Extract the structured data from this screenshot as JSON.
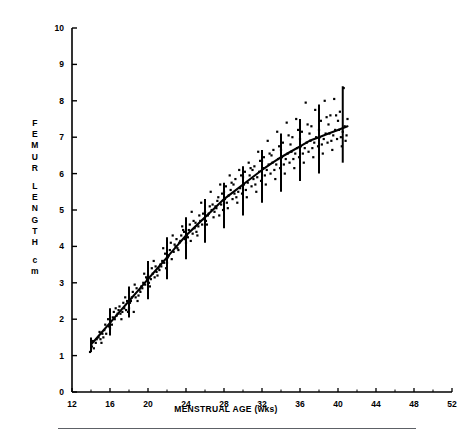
{
  "chart_data": {
    "type": "scatter",
    "title": "",
    "subtitle": "",
    "xlabel": "MENSTRUAL AGE (wks)",
    "ylabel_lines": [
      "F",
      "E",
      "M",
      "U",
      "R",
      "",
      "L",
      "E",
      "N",
      "G",
      "T",
      "H",
      "",
      "c",
      "m"
    ],
    "ylabel_text": "FEMUR LENGTH cm",
    "xlim": [
      12,
      52
    ],
    "ylim": [
      0,
      10
    ],
    "xticks": [
      12,
      16,
      20,
      24,
      28,
      32,
      36,
      40,
      44,
      48,
      52
    ],
    "yticks": [
      0,
      1,
      2,
      3,
      4,
      5,
      6,
      7,
      8,
      9,
      10
    ],
    "x_minor_step": 2,
    "grid": false,
    "legend": false,
    "series": [
      {
        "name": "Regression curve (mean femur length)",
        "type": "line",
        "color": "#000000",
        "x": [
          14,
          15,
          16,
          17,
          18,
          19,
          20,
          21,
          22,
          23,
          24,
          25,
          26,
          27,
          28,
          29,
          30,
          31,
          32,
          33,
          34,
          35,
          36,
          37,
          38,
          39,
          40,
          41
        ],
        "y": [
          1.3,
          1.6,
          1.9,
          2.2,
          2.5,
          2.8,
          3.1,
          3.4,
          3.7,
          4.0,
          4.3,
          4.55,
          4.8,
          5.05,
          5.3,
          5.5,
          5.7,
          5.9,
          6.1,
          6.28,
          6.45,
          6.6,
          6.75,
          6.9,
          7.0,
          7.1,
          7.2,
          7.3
        ]
      },
      {
        "name": "Error bars (±2 SD)",
        "type": "errorbar",
        "color": "#000000",
        "x": [
          14,
          16,
          18,
          20,
          22,
          24,
          26,
          28,
          30,
          32,
          34,
          36,
          38,
          40.5
        ],
        "mean": [
          1.3,
          1.9,
          2.5,
          3.1,
          3.7,
          4.3,
          4.8,
          5.3,
          5.7,
          6.1,
          6.45,
          6.75,
          7.0,
          7.3
        ],
        "lower": [
          1.1,
          1.55,
          2.05,
          2.55,
          3.1,
          3.65,
          4.1,
          4.5,
          4.85,
          5.2,
          5.5,
          5.8,
          6.0,
          6.3
        ],
        "upper": [
          1.5,
          2.3,
          2.9,
          3.6,
          4.25,
          4.8,
          5.3,
          5.75,
          6.2,
          6.65,
          7.1,
          7.5,
          7.9,
          8.4
        ]
      },
      {
        "name": "Individual measurements",
        "type": "scatter",
        "color": "#000000",
        "points": [
          [
            13.9,
            1.1
          ],
          [
            14.1,
            1.25
          ],
          [
            14.3,
            1.2
          ],
          [
            14.2,
            1.4
          ],
          [
            14.5,
            1.35
          ],
          [
            14.8,
            1.5
          ],
          [
            15.0,
            1.45
          ],
          [
            15.2,
            1.6
          ],
          [
            15.1,
            1.35
          ],
          [
            15.4,
            1.7
          ],
          [
            15.6,
            1.6
          ],
          [
            15.3,
            1.5
          ],
          [
            15.9,
            1.8
          ],
          [
            16.1,
            1.95
          ],
          [
            16.0,
            1.75
          ],
          [
            16.3,
            2.05
          ],
          [
            16.2,
            1.85
          ],
          [
            16.5,
            2.0
          ],
          [
            16.4,
            2.2
          ],
          [
            16.7,
            2.1
          ],
          [
            16.9,
            2.25
          ],
          [
            17.1,
            2.15
          ],
          [
            17.0,
            2.35
          ],
          [
            17.3,
            2.2
          ],
          [
            17.2,
            2.0
          ],
          [
            17.5,
            2.3
          ],
          [
            17.7,
            2.25
          ],
          [
            17.4,
            2.45
          ],
          [
            17.9,
            2.2
          ],
          [
            18.1,
            2.45
          ],
          [
            18.0,
            2.3
          ],
          [
            18.3,
            2.6
          ],
          [
            18.2,
            2.5
          ],
          [
            18.5,
            2.2
          ],
          [
            18.4,
            2.75
          ],
          [
            18.7,
            2.6
          ],
          [
            18.9,
            2.5
          ],
          [
            19.1,
            2.8
          ],
          [
            19.0,
            2.65
          ],
          [
            19.3,
            2.9
          ],
          [
            19.2,
            2.75
          ],
          [
            19.5,
            3.0
          ],
          [
            19.4,
            2.85
          ],
          [
            19.7,
            2.95
          ],
          [
            19.9,
            3.1
          ],
          [
            20.1,
            3.0
          ],
          [
            20.0,
            3.2
          ],
          [
            20.3,
            3.1
          ],
          [
            20.2,
            2.9
          ],
          [
            20.5,
            3.25
          ],
          [
            20.4,
            3.4
          ],
          [
            20.7,
            3.15
          ],
          [
            20.9,
            3.3
          ],
          [
            21.1,
            3.4
          ],
          [
            21.0,
            3.2
          ],
          [
            21.3,
            3.5
          ],
          [
            21.2,
            3.35
          ],
          [
            21.5,
            3.6
          ],
          [
            21.4,
            3.45
          ],
          [
            21.7,
            3.55
          ],
          [
            21.9,
            3.4
          ],
          [
            22.1,
            3.7
          ],
          [
            22.0,
            3.55
          ],
          [
            22.3,
            3.9
          ],
          [
            22.2,
            3.75
          ],
          [
            22.5,
            3.65
          ],
          [
            22.4,
            4.1
          ],
          [
            22.7,
            3.85
          ],
          [
            22.9,
            4.0
          ],
          [
            23.1,
            3.95
          ],
          [
            23.0,
            4.2
          ],
          [
            23.3,
            4.1
          ],
          [
            23.2,
            3.9
          ],
          [
            23.5,
            4.3
          ],
          [
            23.4,
            4.15
          ],
          [
            23.7,
            4.45
          ],
          [
            23.9,
            4.2
          ],
          [
            24.1,
            4.3
          ],
          [
            24.0,
            4.1
          ],
          [
            24.3,
            4.45
          ],
          [
            24.2,
            4.25
          ],
          [
            24.5,
            4.15
          ],
          [
            24.4,
            4.6
          ],
          [
            24.7,
            4.35
          ],
          [
            24.9,
            4.5
          ],
          [
            25.1,
            4.4
          ],
          [
            25.0,
            4.65
          ],
          [
            25.3,
            4.55
          ],
          [
            25.2,
            4.3
          ],
          [
            25.5,
            4.7
          ],
          [
            25.4,
            4.85
          ],
          [
            25.7,
            4.6
          ],
          [
            25.9,
            4.75
          ],
          [
            26.1,
            4.7
          ],
          [
            26.0,
            4.95
          ],
          [
            26.3,
            4.85
          ],
          [
            26.2,
            4.6
          ],
          [
            26.5,
            5.1
          ],
          [
            26.4,
            4.9
          ],
          [
            26.7,
            5.0
          ],
          [
            26.9,
            4.8
          ],
          [
            27.1,
            5.1
          ],
          [
            27.0,
            4.95
          ],
          [
            27.3,
            5.25
          ],
          [
            27.2,
            5.05
          ],
          [
            27.5,
            4.85
          ],
          [
            27.4,
            5.35
          ],
          [
            27.7,
            5.15
          ],
          [
            27.9,
            5.0
          ],
          [
            28.1,
            5.3
          ],
          [
            28.0,
            5.5
          ],
          [
            28.3,
            5.2
          ],
          [
            28.2,
            5.65
          ],
          [
            28.5,
            5.4
          ],
          [
            28.4,
            5.05
          ],
          [
            28.7,
            5.55
          ],
          [
            28.9,
            5.3
          ],
          [
            29.1,
            5.45
          ],
          [
            29.0,
            5.7
          ],
          [
            29.3,
            5.35
          ],
          [
            29.2,
            5.85
          ],
          [
            29.5,
            5.5
          ],
          [
            29.4,
            5.2
          ],
          [
            29.7,
            5.6
          ],
          [
            29.9,
            5.45
          ],
          [
            30.1,
            5.7
          ],
          [
            30.0,
            5.9
          ],
          [
            30.3,
            5.55
          ],
          [
            30.2,
            6.05
          ],
          [
            30.5,
            5.75
          ],
          [
            30.4,
            5.35
          ],
          [
            30.7,
            5.95
          ],
          [
            30.9,
            5.65
          ],
          [
            31.1,
            5.85
          ],
          [
            31.0,
            6.1
          ],
          [
            31.3,
            5.7
          ],
          [
            31.2,
            6.2
          ],
          [
            31.5,
            5.9
          ],
          [
            31.4,
            5.5
          ],
          [
            31.7,
            6.05
          ],
          [
            31.9,
            5.8
          ],
          [
            32.1,
            6.15
          ],
          [
            32.0,
            6.35
          ],
          [
            32.3,
            5.95
          ],
          [
            32.2,
            6.45
          ],
          [
            32.5,
            6.1
          ],
          [
            32.4,
            5.7
          ],
          [
            32.7,
            6.25
          ],
          [
            32.9,
            6.0
          ],
          [
            33.1,
            6.3
          ],
          [
            33.0,
            6.5
          ],
          [
            33.3,
            6.1
          ],
          [
            33.2,
            6.65
          ],
          [
            33.5,
            6.25
          ],
          [
            33.4,
            5.85
          ],
          [
            33.7,
            6.4
          ],
          [
            33.9,
            6.15
          ],
          [
            34.1,
            6.45
          ],
          [
            34.0,
            6.65
          ],
          [
            34.3,
            6.25
          ],
          [
            34.2,
            6.85
          ],
          [
            34.5,
            6.4
          ],
          [
            34.4,
            6.0
          ],
          [
            34.7,
            6.55
          ],
          [
            34.9,
            6.3
          ],
          [
            35.1,
            6.6
          ],
          [
            35.0,
            6.8
          ],
          [
            35.3,
            6.4
          ],
          [
            35.2,
            7.0
          ],
          [
            35.5,
            6.55
          ],
          [
            35.4,
            6.15
          ],
          [
            35.7,
            6.7
          ],
          [
            35.9,
            6.45
          ],
          [
            36.1,
            6.75
          ],
          [
            36.0,
            6.95
          ],
          [
            36.3,
            6.55
          ],
          [
            36.2,
            7.15
          ],
          [
            36.5,
            6.7
          ],
          [
            36.4,
            6.3
          ],
          [
            36.7,
            6.85
          ],
          [
            36.9,
            6.6
          ],
          [
            37.1,
            6.9
          ],
          [
            37.0,
            7.1
          ],
          [
            37.3,
            6.7
          ],
          [
            37.2,
            7.3
          ],
          [
            37.5,
            6.85
          ],
          [
            37.4,
            6.45
          ],
          [
            37.7,
            7.0
          ],
          [
            37.9,
            6.75
          ],
          [
            38.1,
            7.0
          ],
          [
            38.0,
            7.2
          ],
          [
            38.3,
            6.8
          ],
          [
            38.2,
            7.45
          ],
          [
            38.5,
            6.95
          ],
          [
            38.4,
            6.55
          ],
          [
            38.7,
            7.1
          ],
          [
            38.9,
            6.85
          ],
          [
            39.1,
            7.1
          ],
          [
            39.0,
            7.35
          ],
          [
            39.3,
            6.9
          ],
          [
            39.2,
            7.6
          ],
          [
            39.5,
            7.05
          ],
          [
            39.4,
            6.65
          ],
          [
            39.7,
            7.2
          ],
          [
            39.9,
            6.95
          ],
          [
            40.1,
            7.2
          ],
          [
            40.0,
            7.45
          ],
          [
            40.3,
            7.0
          ],
          [
            40.2,
            7.7
          ],
          [
            40.5,
            7.15
          ],
          [
            40.4,
            6.75
          ],
          [
            40.7,
            7.3
          ],
          [
            40.9,
            7.05
          ],
          [
            41.0,
            7.5
          ],
          [
            40.8,
            6.9
          ],
          [
            36.6,
            7.95
          ],
          [
            38.6,
            8.0
          ],
          [
            39.6,
            8.05
          ],
          [
            40.6,
            8.35
          ],
          [
            37.6,
            7.75
          ],
          [
            35.6,
            7.5
          ],
          [
            34.6,
            7.4
          ],
          [
            33.6,
            7.15
          ],
          [
            32.6,
            6.9
          ],
          [
            31.6,
            6.6
          ],
          [
            30.6,
            6.3
          ],
          [
            29.6,
            6.1
          ],
          [
            28.6,
            5.95
          ],
          [
            27.6,
            5.7
          ],
          [
            26.6,
            5.5
          ],
          [
            25.6,
            5.2
          ],
          [
            24.6,
            4.95
          ],
          [
            23.6,
            4.55
          ],
          [
            22.6,
            4.3
          ],
          [
            21.6,
            3.95
          ],
          [
            20.6,
            3.6
          ],
          [
            19.6,
            3.25
          ],
          [
            18.6,
            2.95
          ],
          [
            17.6,
            2.6
          ],
          [
            16.6,
            2.3
          ],
          [
            15.8,
            2.0
          ],
          [
            15.5,
            1.85
          ],
          [
            14.9,
            1.65
          ],
          [
            14.6,
            1.45
          ],
          [
            38.8,
            7.55
          ],
          [
            39.8,
            7.6
          ],
          [
            36.8,
            7.35
          ],
          [
            35.8,
            7.2
          ],
          [
            34.8,
            7.05
          ],
          [
            33.8,
            6.75
          ],
          [
            32.8,
            6.55
          ],
          [
            31.8,
            6.35
          ],
          [
            30.8,
            6.15
          ],
          [
            29.8,
            5.95
          ],
          [
            28.8,
            5.75
          ],
          [
            27.8,
            5.45
          ],
          [
            26.8,
            5.15
          ],
          [
            25.8,
            4.9
          ],
          [
            24.8,
            4.7
          ],
          [
            23.8,
            4.4
          ],
          [
            22.8,
            4.05
          ],
          [
            21.8,
            3.8
          ],
          [
            20.8,
            3.45
          ],
          [
            19.8,
            3.15
          ],
          [
            18.8,
            2.85
          ],
          [
            17.8,
            2.5
          ],
          [
            16.8,
            2.15
          ]
        ]
      }
    ]
  },
  "axis": {
    "x_tick_labels": [
      "12",
      "16",
      "20",
      "24",
      "28",
      "32",
      "36",
      "40",
      "44",
      "48",
      "52"
    ],
    "y_tick_labels": [
      "0",
      "1",
      "2",
      "3",
      "4",
      "5",
      "6",
      "7",
      "8",
      "9",
      "10"
    ]
  }
}
